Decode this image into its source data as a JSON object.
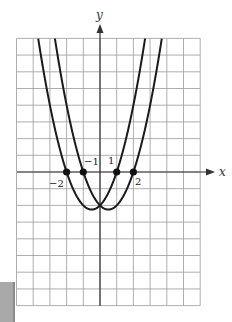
{
  "chart_data": {
    "type": "line",
    "title": "",
    "xlabel": "x",
    "ylabel": "y",
    "xlim": [
      -5,
      6
    ],
    "ylim": [
      -8,
      8
    ],
    "grid": true,
    "legend": null,
    "series": [
      {
        "name": "y = (x+2)(x-1)",
        "roots": [
          -2,
          1
        ],
        "a": 1,
        "vertex": [
          -0.5,
          -2.25
        ]
      },
      {
        "name": "y = (x+1)(x-2)",
        "roots": [
          -1,
          2
        ],
        "a": 1,
        "vertex": [
          0.5,
          -2.25
        ]
      }
    ],
    "points": [
      {
        "x": -2,
        "y": 0,
        "label": "−2"
      },
      {
        "x": -1,
        "y": 0,
        "label": "−1"
      },
      {
        "x": 1,
        "y": 0,
        "label": "1"
      },
      {
        "x": 2,
        "y": 0,
        "label": "2"
      }
    ],
    "intersection": [
      0,
      -2
    ]
  },
  "labels": {
    "x_axis": "x",
    "y_axis": "y",
    "pt_m2": "−2",
    "pt_m1": "−1",
    "pt_1": "1",
    "pt_2": "2"
  }
}
